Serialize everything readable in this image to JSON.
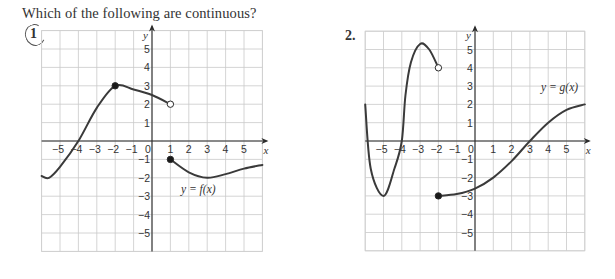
{
  "header": {
    "question": "Which of the following are continuous?"
  },
  "problems": [
    {
      "number": "1",
      "circled": true
    },
    {
      "number": "2.",
      "circled": false
    }
  ],
  "chart_data": [
    {
      "type": "line",
      "title": "1",
      "function_label": "y = f(x)",
      "xlabel": "x",
      "ylabel": "y",
      "xlim": [
        -6,
        6
      ],
      "ylim": [
        -6,
        6
      ],
      "grid": true,
      "x_ticks": [
        -5,
        -4,
        -3,
        -2,
        -1,
        0,
        1,
        2,
        3,
        4,
        5
      ],
      "y_ticks": [
        -5,
        -4,
        -3,
        -2,
        -1,
        1,
        2,
        3,
        4,
        5
      ],
      "series": [
        {
          "name": "piece 1",
          "points": [
            [
              -6,
              -1.9
            ],
            [
              -5.6,
              -2
            ],
            [
              -5,
              -1.4
            ],
            [
              -4,
              0
            ],
            [
              -3,
              1.8
            ],
            [
              -2,
              3
            ],
            [
              -1,
              2.8
            ],
            [
              0,
              2.5
            ],
            [
              1,
              2
            ]
          ],
          "endpoints": [
            {
              "x": -2,
              "y": 3,
              "type": "closed"
            },
            {
              "x": 1,
              "y": 2,
              "type": "open"
            }
          ]
        },
        {
          "name": "piece 2",
          "points": [
            [
              1,
              -1
            ],
            [
              2,
              -1.7
            ],
            [
              3,
              -2
            ],
            [
              4,
              -1.8
            ],
            [
              5,
              -1.5
            ],
            [
              6,
              -1.3
            ]
          ],
          "endpoints": [
            {
              "x": 1,
              "y": -1,
              "type": "closed"
            }
          ]
        }
      ]
    },
    {
      "type": "line",
      "title": "2.",
      "function_label": "y = g(x)",
      "xlabel": "x",
      "ylabel": "y",
      "xlim": [
        -6,
        6
      ],
      "ylim": [
        -6,
        6
      ],
      "grid": true,
      "x_ticks": [
        -5,
        -4,
        -3,
        -2,
        -1,
        0,
        1,
        2,
        3,
        4,
        5
      ],
      "y_ticks": [
        -5,
        -4,
        -3,
        -2,
        -1,
        1,
        2,
        3,
        4,
        5
      ],
      "series": [
        {
          "name": "piece 1",
          "points": [
            [
              -6,
              2
            ],
            [
              -5.7,
              -1.5
            ],
            [
              -5,
              -3
            ],
            [
              -4.4,
              -1.5
            ],
            [
              -4,
              0
            ],
            [
              -3.8,
              2.5
            ],
            [
              -3.5,
              4.3
            ],
            [
              -3,
              5.3
            ],
            [
              -2.5,
              5
            ],
            [
              -2,
              4
            ]
          ],
          "endpoints": [
            {
              "x": -2,
              "y": 4,
              "type": "open"
            }
          ]
        },
        {
          "name": "piece 2",
          "points": [
            [
              -2,
              -3
            ],
            [
              -1,
              -2.9
            ],
            [
              0,
              -2.6
            ],
            [
              1,
              -2
            ],
            [
              2,
              -1.1
            ],
            [
              3,
              0
            ],
            [
              4,
              1
            ],
            [
              5,
              1.7
            ],
            [
              6,
              2
            ]
          ],
          "endpoints": [
            {
              "x": -2,
              "y": -3,
              "type": "closed"
            }
          ]
        }
      ]
    }
  ]
}
